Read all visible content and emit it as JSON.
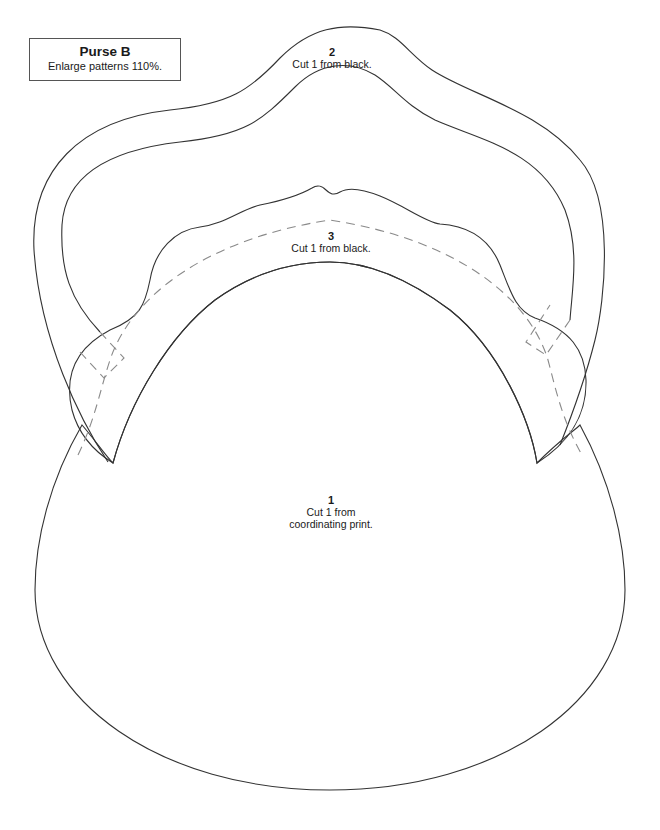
{
  "title_box": {
    "title": "Purse B",
    "subtitle": "Enlarge patterns 110%."
  },
  "pieces": [
    {
      "number": "1",
      "instruction_line1": "Cut 1 from",
      "instruction_line2": "coordinating print.",
      "description": "purse body"
    },
    {
      "number": "2",
      "instruction_line1": "Cut 1 from black.",
      "description": "handle"
    },
    {
      "number": "3",
      "instruction_line1": "Cut 1 from black.",
      "description": "top band"
    }
  ],
  "colors": {
    "cut_line": "#333333",
    "placement_line": "#8a8a8a",
    "background": "#ffffff"
  }
}
